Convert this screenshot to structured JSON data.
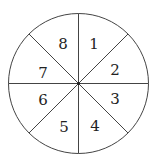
{
  "diagram": {
    "type": "spinner",
    "sectors": 8,
    "center": [
      78.5,
      83.5
    ],
    "radius": 70,
    "stroke_color": "#444444",
    "labels": [
      {
        "text": "1",
        "x": 94,
        "y": 49
      },
      {
        "text": "2",
        "x": 115,
        "y": 75
      },
      {
        "text": "3",
        "x": 115,
        "y": 104
      },
      {
        "text": "4",
        "x": 95,
        "y": 131
      },
      {
        "text": "5",
        "x": 64,
        "y": 132
      },
      {
        "text": "6",
        "x": 43,
        "y": 105
      },
      {
        "text": "7",
        "x": 43,
        "y": 78
      },
      {
        "text": "8",
        "x": 63,
        "y": 49
      }
    ]
  }
}
